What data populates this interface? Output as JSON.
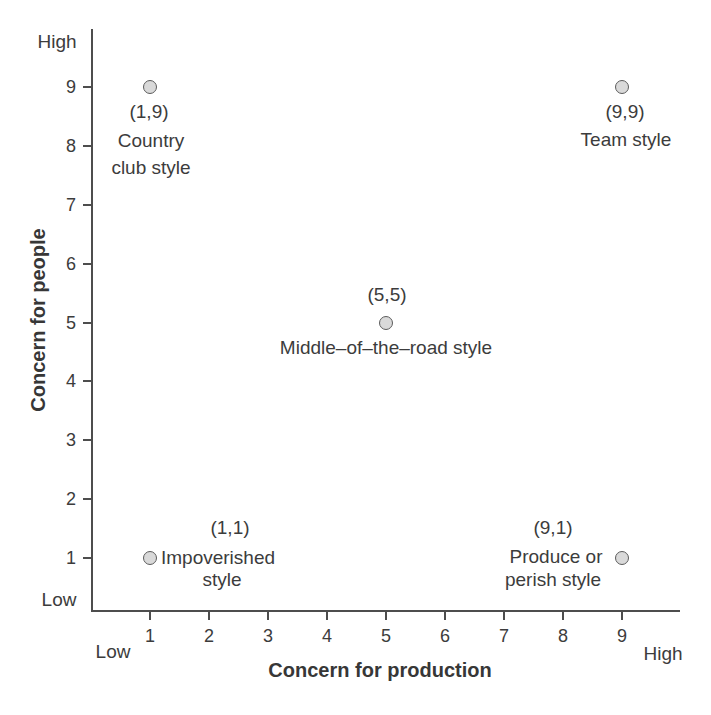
{
  "chart_data": {
    "type": "scatter",
    "title": "",
    "xlabel": "Concern for production",
    "ylabel": "Concern for people",
    "xlim": [
      0,
      10
    ],
    "ylim": [
      0,
      10
    ],
    "grid": false,
    "x_ticks": [
      1,
      2,
      3,
      4,
      5,
      6,
      7,
      8,
      9
    ],
    "y_ticks": [
      1,
      2,
      3,
      4,
      5,
      6,
      7,
      8,
      9
    ],
    "x_end_labels": {
      "low": "Low",
      "high": "High"
    },
    "y_end_labels": {
      "low": "Low",
      "high": "High"
    },
    "marker": {
      "fill": "#d9d9d9",
      "stroke": "#5c5c5c",
      "shape": "circle"
    },
    "axis_color": "#4d4d4d",
    "text_color": "#3c3c3c",
    "points": [
      {
        "id": "country-club-style",
        "x": 1,
        "y": 9,
        "coord_label": "(1,9)",
        "label_lines": [
          "Country",
          "club style"
        ],
        "full_name": "Country club style"
      },
      {
        "id": "team-style",
        "x": 9,
        "y": 9,
        "coord_label": "(9,9)",
        "label_lines": [
          "Team style"
        ],
        "full_name": "Team style"
      },
      {
        "id": "middle-of-the-road-style",
        "x": 5,
        "y": 5,
        "coord_label": "(5,5)",
        "label_lines": [
          "Middle–of–the–road style"
        ],
        "full_name": "Middle-of-the-road style"
      },
      {
        "id": "impoverished-style",
        "x": 1,
        "y": 1,
        "coord_label": "(1,1)",
        "label_lines": [
          "Impoverished",
          "style"
        ],
        "full_name": "Impoverished style"
      },
      {
        "id": "produce-or-perish-style",
        "x": 9,
        "y": 1,
        "coord_label": "(9,1)",
        "label_lines": [
          "Produce or",
          "perish style"
        ],
        "full_name": "Produce or perish style"
      }
    ]
  }
}
